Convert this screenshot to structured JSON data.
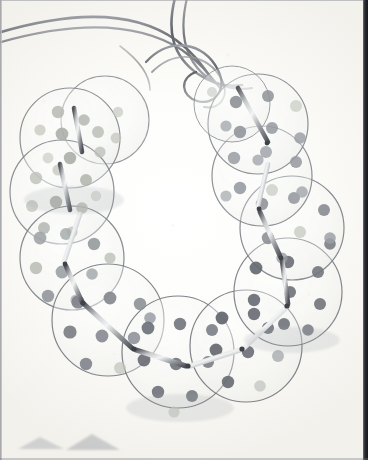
{
  "image": {
    "title": "Polka-dot disc necklace photograph",
    "subject": "handmade necklace",
    "medium": "scanned photograph on off-white paper",
    "background_color": "#fbfaf8",
    "border_color": "#1a1c21",
    "width": 368,
    "height": 460
  },
  "palette": {
    "paper": "#fbfaf8",
    "disc_fill": "rgba(244,245,243,0.45)",
    "disc_outline": "#8d9095",
    "cord": "#7d8086",
    "tube_light": "#e9eaec",
    "tube_dark": "#5f6268",
    "dot_dark": "#6e7279",
    "dot_mid": "#9a9ea2",
    "dot_light": "#c8cbc6",
    "dot_pale": "#dcdfd8",
    "dot_olive": "#b9bdae",
    "shadow": "#cfd1d3"
  },
  "composition": {
    "cords": [
      {
        "name": "cord-left-outer",
        "path": "M -6 34 C 60 14, 128 6, 176 40 C 198 56, 206 72, 214 82"
      },
      {
        "name": "cord-left-inner",
        "path": "M -6 44 C 62 24, 130 16, 180 48 C 200 62, 210 76, 218 86"
      },
      {
        "name": "cord-right-outer",
        "path": "M 176 -6 C 168 32, 176 58, 200 74 C 216 84, 232 86, 244 84"
      },
      {
        "name": "cord-right-inner",
        "path": "M 186 -6 C 176 34, 184 60, 206 76 C 222 86, 238 88, 250 86"
      },
      {
        "name": "cord-loop-center",
        "path": "M 150 64 C 176 40, 206 46, 218 72 C 226 90, 214 104, 198 100 C 182 96, 180 80, 196 74"
      }
    ],
    "discs": [
      {
        "name": "disc-1",
        "cx": 70,
        "cy": 138,
        "r": 50,
        "tone": "light"
      },
      {
        "name": "disc-2",
        "cx": 105,
        "cy": 120,
        "r": 44,
        "tone": "light"
      },
      {
        "name": "disc-3",
        "cx": 62,
        "cy": 192,
        "r": 52,
        "tone": "light"
      },
      {
        "name": "disc-4",
        "cx": 72,
        "cy": 258,
        "r": 52,
        "tone": "mid"
      },
      {
        "name": "disc-5",
        "cx": 108,
        "cy": 320,
        "r": 56,
        "tone": "mid"
      },
      {
        "name": "disc-6",
        "cx": 178,
        "cy": 352,
        "r": 56,
        "tone": "dark"
      },
      {
        "name": "disc-7",
        "cx": 246,
        "cy": 346,
        "r": 56,
        "tone": "dark"
      },
      {
        "name": "disc-8",
        "cx": 288,
        "cy": 292,
        "r": 54,
        "tone": "dark"
      },
      {
        "name": "disc-9",
        "cx": 292,
        "cy": 228,
        "r": 52,
        "tone": "mid"
      },
      {
        "name": "disc-10",
        "cx": 262,
        "cy": 176,
        "r": 50,
        "tone": "mid"
      },
      {
        "name": "disc-11",
        "cx": 258,
        "cy": 124,
        "r": 50,
        "tone": "mid"
      },
      {
        "name": "disc-12",
        "cx": 232,
        "cy": 104,
        "r": 38,
        "tone": "light"
      }
    ],
    "tubes": [
      {
        "name": "tube-1",
        "x1": 74,
        "y1": 110,
        "x2": 82,
        "y2": 150
      },
      {
        "name": "tube-2",
        "x1": 62,
        "y1": 168,
        "x2": 70,
        "y2": 208
      },
      {
        "name": "tube-3",
        "x1": 78,
        "y1": 218,
        "x2": 66,
        "y2": 262
      },
      {
        "name": "tube-4",
        "x1": 68,
        "y1": 268,
        "x2": 82,
        "y2": 300
      },
      {
        "name": "tube-5",
        "x1": 84,
        "y1": 304,
        "x2": 132,
        "y2": 348
      },
      {
        "name": "tube-6",
        "x1": 136,
        "y1": 350,
        "x2": 186,
        "y2": 364
      },
      {
        "name": "tube-7",
        "x1": 190,
        "y1": 364,
        "x2": 240,
        "y2": 350
      },
      {
        "name": "tube-8",
        "x1": 244,
        "y1": 348,
        "x2": 284,
        "y2": 310
      },
      {
        "name": "tube-9",
        "x1": 286,
        "y1": 306,
        "x2": 282,
        "y2": 262
      },
      {
        "name": "tube-10",
        "x1": 280,
        "y1": 258,
        "x2": 262,
        "y2": 214
      },
      {
        "name": "tube-11",
        "x1": 260,
        "y1": 208,
        "x2": 268,
        "y2": 168
      },
      {
        "name": "tube-12",
        "x1": 240,
        "y1": 92,
        "x2": 266,
        "y2": 140
      }
    ],
    "dot_count": 96,
    "smudges": [
      {
        "name": "smudge-left",
        "x": 18,
        "y": 437,
        "w": 46,
        "h": 12
      },
      {
        "name": "smudge-right",
        "x": 66,
        "y": 434,
        "w": 52,
        "h": 14
      }
    ]
  }
}
